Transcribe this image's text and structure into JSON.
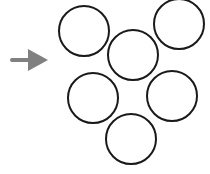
{
  "diagram": {
    "arrow": {
      "direction": "right",
      "color": "#808080",
      "shaft": {
        "x1": 12,
        "y1": 60,
        "x2": 31,
        "y2": 60,
        "width": 4
      },
      "head": {
        "points": "28,49 48,60 28,71"
      }
    },
    "circles": {
      "stroke": "#1a1a1a",
      "stroke_width": 2,
      "fill": "none",
      "items": [
        {
          "cx": 84,
          "cy": 31,
          "r": 25
        },
        {
          "cx": 179,
          "cy": 24,
          "r": 25
        },
        {
          "cx": 133,
          "cy": 55,
          "r": 25
        },
        {
          "cx": 93,
          "cy": 98,
          "r": 25
        },
        {
          "cx": 172,
          "cy": 96,
          "r": 25
        },
        {
          "cx": 131,
          "cy": 139,
          "r": 25
        }
      ]
    }
  }
}
